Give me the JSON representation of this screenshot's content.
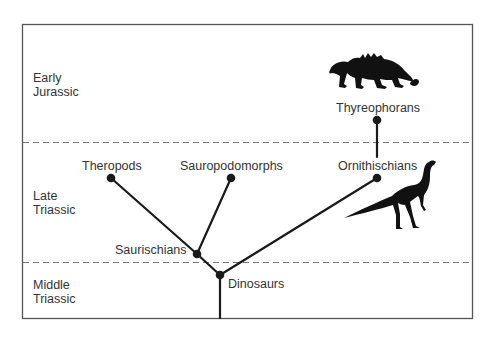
{
  "colors": {
    "ink": "#1a1a1a",
    "frame": "#555555",
    "dash": "#777777",
    "text": "#333333"
  },
  "periods": [
    {
      "id": "early-jurassic",
      "lines": [
        "Early",
        "Jurassic"
      ]
    },
    {
      "id": "late-triassic",
      "lines": [
        "Late",
        "Triassic"
      ]
    },
    {
      "id": "middle-triassic",
      "lines": [
        "Middle",
        "Triassic"
      ]
    }
  ],
  "clades": {
    "theropods": "Theropods",
    "sauropodomorphs": "Sauropodomorphs",
    "ornithischians": "Ornithischians",
    "thyreophorans": "Thyreophorans",
    "saurischians": "Saurischians",
    "dinosaurs": "Dinosaurs"
  },
  "tree": {
    "root": "dinosaurs",
    "edges": [
      [
        "dinosaurs",
        "saurischians"
      ],
      [
        "dinosaurs",
        "ornithischians"
      ],
      [
        "saurischians",
        "theropods"
      ],
      [
        "saurischians",
        "sauropodomorphs"
      ],
      [
        "ornithischians",
        "thyreophorans"
      ]
    ]
  },
  "silhouettes": [
    {
      "id": "ankylosaur-silhouette",
      "depicts": "thyreophoran (armored quadruped)"
    },
    {
      "id": "ornithischian-silhouette",
      "depicts": "bipedal ornithischian"
    }
  ]
}
